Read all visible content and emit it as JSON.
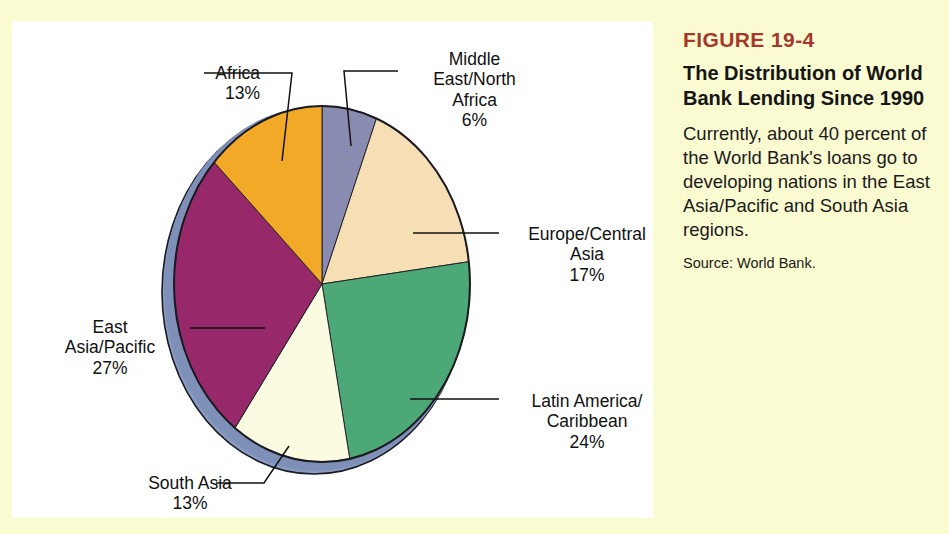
{
  "page": {
    "background_color": "#FBFBD2",
    "panel_color": "#FFFFFF"
  },
  "caption": {
    "figure_number": "FIGURE 19-4",
    "figure_number_color": "#A4382C",
    "title": "The Distribution of World Bank Lending Since 1990",
    "description": "Currently, about 40 percent of the World Bank's loans go to developing nations in the East Asia/Pacific and South Asia regions.",
    "source": "Source: World Bank."
  },
  "labels": {
    "africa": "Africa\n13%",
    "middle_east_north_africa": "Middle\nEast/North\nAfrica\n6%",
    "europe_central_asia": "Europe/Central\nAsia\n17%",
    "latin_america_caribbean": "Latin America/\nCaribbean\n24%",
    "south_asia": "South Asia\n13%",
    "east_asia_pacific": "East\nAsia/Pacific\n27%"
  },
  "chart_data": {
    "type": "pie",
    "title": "The Distribution of World Bank Lending Since 1990",
    "subtitle": "",
    "xlabel": "",
    "ylabel": "",
    "unit": "percent",
    "total": 100,
    "legend_position": "callout-labels",
    "grid": false,
    "three_d": true,
    "start_angle_deg": 0,
    "direction": "clockwise",
    "categories": [
      "Middle East/North Africa",
      "Europe/Central Asia",
      "Latin America/Caribbean",
      "South Asia",
      "East Asia/Pacific",
      "Africa"
    ],
    "values": [
      6,
      17,
      24,
      13,
      27,
      13
    ],
    "colors": [
      "#8A8BB0",
      "#F7DFB5",
      "#4CA877",
      "#FBFBE1",
      "#97296B",
      "#F2A928"
    ],
    "slices": [
      {
        "label": "Middle East/North Africa",
        "value": 6,
        "display": "6%",
        "color": "#8A8BB0"
      },
      {
        "label": "Europe/Central Asia",
        "value": 17,
        "display": "17%",
        "color": "#F7DFB5"
      },
      {
        "label": "Latin America/Caribbean",
        "value": 24,
        "display": "24%",
        "color": "#4CA877"
      },
      {
        "label": "South Asia",
        "value": 13,
        "display": "13%",
        "color": "#FBFBE1"
      },
      {
        "label": "East Asia/Pacific",
        "value": 27,
        "display": "27%",
        "color": "#97296B"
      },
      {
        "label": "Africa",
        "value": 13,
        "display": "13%",
        "color": "#F2A928"
      }
    ],
    "side_edge_color": "#8A9BC2",
    "outline_color": "#1A1A20",
    "annotations": [
      "Currently, about 40 percent of the World Bank's loans go to developing nations in the East Asia/Pacific and South Asia regions."
    ]
  }
}
